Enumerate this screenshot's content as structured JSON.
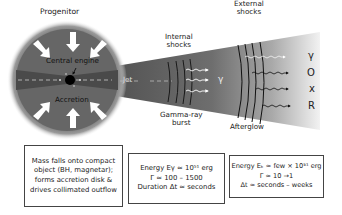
{
  "labels": {
    "progenitor": "Progenitor",
    "central_engine": "Central engine",
    "accretion": "Accretion",
    "jet": "Jet",
    "internal_shocks_1": "Internal",
    "internal_shocks_2": "shocks",
    "gamma_symbol": "γ",
    "grb_1": "Gamma-ray",
    "grb_2": "burst",
    "external_shocks_1": "External",
    "external_shocks_2": "shocks",
    "afterglow": "Afterglow"
  },
  "afterglow_bands": [
    "γ",
    "O",
    "x",
    "R"
  ],
  "boxes": {
    "progenitor": [
      "Mass falls onto compact",
      "object (BH, magnetar);",
      "forms accretion disk &",
      "drives collimated outflow"
    ],
    "prompt": [
      "Energy Eγ ≈ 10⁵¹ erg",
      "Γ ≈ 100 – 1500",
      "Duration Δt ≈ seconds"
    ],
    "afterglow": [
      "Energy Eₖ ≈ few × 10⁵¹ erg",
      "Γ ≈ 10 →1",
      "Δt ≈ seconds – weeks"
    ]
  },
  "colors": {
    "cone_dark": "#555555",
    "cone_light": "#d8d8d8",
    "sphere": "#6b6b6b",
    "arrow": "#ffffff"
  }
}
